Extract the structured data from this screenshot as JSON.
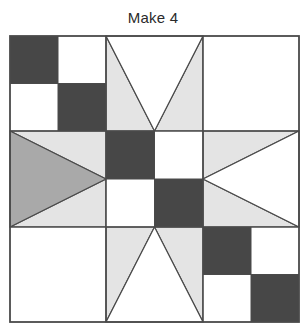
{
  "title": "Make 4",
  "colors": {
    "dark": "#474747",
    "medium": "#a9a9a9",
    "light": "#e4e4e4",
    "white": "#ffffff",
    "line": "#4a4a4a"
  },
  "block": {
    "grid": "3x3",
    "x": [
      10,
      106,
      203,
      299
    ],
    "y": [
      36,
      131,
      227,
      322
    ],
    "cells": [
      {
        "row": 0,
        "col": 0,
        "type": "four-patch",
        "pattern": [
          "dark",
          "white",
          "white",
          "dark"
        ]
      },
      {
        "row": 0,
        "col": 1,
        "type": "star-point",
        "direction": "down",
        "point": "white",
        "sides": "light"
      },
      {
        "row": 0,
        "col": 2,
        "type": "plain",
        "fill": "white"
      },
      {
        "row": 1,
        "col": 0,
        "type": "star-point",
        "direction": "right",
        "point": "medium",
        "sides": "light"
      },
      {
        "row": 1,
        "col": 1,
        "type": "four-patch",
        "pattern": [
          "dark",
          "white",
          "white",
          "dark"
        ]
      },
      {
        "row": 1,
        "col": 2,
        "type": "star-point",
        "direction": "left",
        "point": "white",
        "sides": "light"
      },
      {
        "row": 2,
        "col": 0,
        "type": "plain",
        "fill": "white"
      },
      {
        "row": 2,
        "col": 1,
        "type": "star-point",
        "direction": "up",
        "point": "white",
        "sides": "light"
      },
      {
        "row": 2,
        "col": 2,
        "type": "four-patch",
        "pattern": [
          "dark",
          "white",
          "white",
          "dark"
        ]
      }
    ]
  }
}
